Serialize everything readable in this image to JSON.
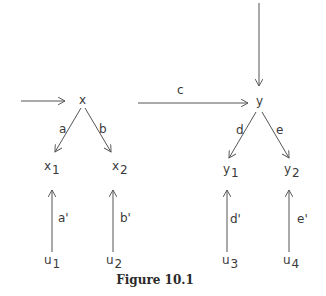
{
  "figure": {
    "caption": "Figure 10.1",
    "line_color": "#555555"
  },
  "nodes": {
    "x": {
      "label": "x",
      "sub": ""
    },
    "x1": {
      "label": "x",
      "sub": "1"
    },
    "x2": {
      "label": "x",
      "sub": "2"
    },
    "y": {
      "label": "y",
      "sub": ""
    },
    "y1": {
      "label": "y",
      "sub": "1"
    },
    "y2": {
      "label": "y",
      "sub": "2"
    },
    "u1": {
      "label": "u",
      "sub": "1"
    },
    "u2": {
      "label": "u",
      "sub": "2"
    },
    "u3": {
      "label": "u",
      "sub": "3"
    },
    "u4": {
      "label": "u",
      "sub": "4"
    }
  },
  "edges": {
    "a": "a",
    "b": "b",
    "c": "c",
    "d": "d",
    "e": "e",
    "a_prime": "a'",
    "b_prime": "b'",
    "d_prime": "d'",
    "e_prime": "e'"
  }
}
